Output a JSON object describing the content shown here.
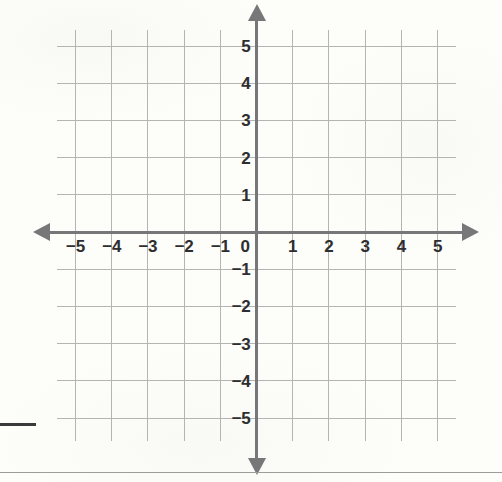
{
  "page": {
    "background_color": "#fdfdfa",
    "width": 502,
    "height": 482
  },
  "graph": {
    "title": "",
    "axis_color": "#77777a",
    "grid_color": "#b4b4b2",
    "label_color": "#2e2e30",
    "origin_label": "0",
    "x_axis": {
      "name": "x-axis",
      "labels": [
        "−5",
        "−4",
        "−3",
        "−2",
        "−1",
        "1",
        "2",
        "3",
        "4",
        "5"
      ],
      "values": [
        -5,
        -4,
        -3,
        -2,
        -1,
        1,
        2,
        3,
        4,
        5
      ],
      "has_left_arrow": true,
      "has_right_arrow": true
    },
    "y_axis": {
      "name": "y-axis",
      "labels": [
        "5",
        "4",
        "3",
        "2",
        "1",
        "−1",
        "−2",
        "−3",
        "−4",
        "−5"
      ],
      "values": [
        5,
        4,
        3,
        2,
        1,
        -1,
        -2,
        -3,
        -4,
        -5
      ],
      "has_up_arrow": true,
      "has_down_arrow": true
    }
  },
  "marks": {
    "left_dash": "",
    "bottom_rule": ""
  },
  "chart_data": {
    "type": "scatter",
    "xlabel": "",
    "ylabel": "",
    "xlim": [
      -5.5,
      5.5
    ],
    "ylim": [
      -5.5,
      5.5
    ],
    "x_ticks": [
      -5,
      -4,
      -3,
      -2,
      -1,
      0,
      1,
      2,
      3,
      4,
      5
    ],
    "y_ticks": [
      -5,
      -4,
      -3,
      -2,
      -1,
      0,
      1,
      2,
      3,
      4,
      5
    ],
    "x_tick_labels": [
      "−5",
      "−4",
      "−3",
      "−2",
      "−1",
      "0",
      "1",
      "2",
      "3",
      "4",
      "5"
    ],
    "y_tick_labels": [
      "−5",
      "−4",
      "−3",
      "−2",
      "−1",
      "0",
      "1",
      "2",
      "3",
      "4",
      "5"
    ],
    "grid": true,
    "legend": null,
    "series": [],
    "annotations": []
  }
}
